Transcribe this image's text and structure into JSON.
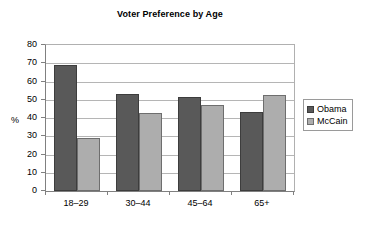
{
  "chart_data": {
    "type": "bar",
    "title": "Voter Preference by Age",
    "xlabel": "",
    "ylabel": "%",
    "categories": [
      "18–29",
      "30–44",
      "45–64",
      "65+"
    ],
    "series": [
      {
        "name": "Obama",
        "color": "#595959",
        "values": [
          69,
          53,
          51.5,
          43.5
        ]
      },
      {
        "name": "McCain",
        "color": "#adadad",
        "values": [
          29,
          43,
          47,
          52.5
        ]
      }
    ],
    "ylim": [
      0,
      80
    ],
    "ytick_step": 10,
    "ytick_labels": [
      "0",
      "10",
      "20",
      "30",
      "40",
      "50",
      "60",
      "70",
      "80"
    ],
    "grid": true,
    "legend_position": "right"
  },
  "legend": {
    "entries": [
      {
        "label": "Obama"
      },
      {
        "label": "McCain"
      }
    ]
  }
}
